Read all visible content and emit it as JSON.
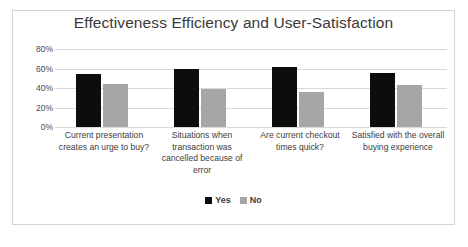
{
  "chart_data": {
    "type": "bar",
    "title": "Effectiveness Efficiency and User-Satisfaction",
    "xlabel": "",
    "ylabel": "",
    "ylim": [
      0,
      80
    ],
    "grid": true,
    "legend_position": "bottom",
    "categories": [
      "Current presentation creates an urge to buy?",
      "Situations when transaction was cancelled because of error",
      "Are current checkout times quick?",
      "Satisfied with the overall buying experience"
    ],
    "ticklabels": [
      "0%",
      "20%",
      "40%",
      "60%",
      "80%"
    ],
    "tickvalues": [
      0,
      20,
      40,
      60,
      80
    ],
    "series": [
      {
        "name": "Yes",
        "color": "#0d0d0d",
        "values": [
          54,
          60,
          62,
          55
        ]
      },
      {
        "name": "No",
        "color": "#a6a6a6",
        "values": [
          44,
          39,
          36,
          43
        ]
      }
    ]
  },
  "legend": {
    "items": [
      {
        "label": "Yes"
      },
      {
        "label": "No"
      }
    ]
  }
}
